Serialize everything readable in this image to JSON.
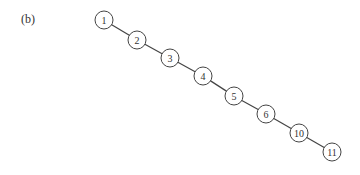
{
  "panel_label": "(b)",
  "tree": {
    "nodes": [
      {
        "id": "1",
        "x": 104,
        "y": 20
      },
      {
        "id": "2",
        "x": 137,
        "y": 40
      },
      {
        "id": "3",
        "x": 170,
        "y": 58
      },
      {
        "id": "4",
        "x": 203,
        "y": 76
      },
      {
        "id": "5",
        "x": 234,
        "y": 96
      },
      {
        "id": "6",
        "x": 266,
        "y": 114
      },
      {
        "id": "10",
        "x": 299,
        "y": 133
      },
      {
        "id": "11",
        "x": 332,
        "y": 152
      }
    ],
    "edges": [
      [
        "1",
        "2"
      ],
      [
        "2",
        "3"
      ],
      [
        "3",
        "4"
      ],
      [
        "4",
        "5"
      ],
      [
        "5",
        "6"
      ],
      [
        "6",
        "10"
      ],
      [
        "10",
        "11"
      ]
    ]
  }
}
